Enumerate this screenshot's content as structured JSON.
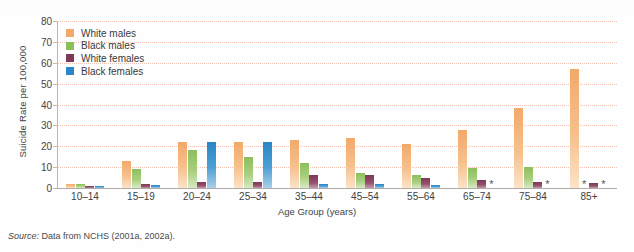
{
  "figure": {
    "title_fragment": "",
    "source_note": "Source: Data from NCHS (2001a, 2002a)."
  },
  "legend": {
    "position": "top-left-inside",
    "items": [
      {
        "label": "White males",
        "color": "#f3a96a",
        "key": "white_males"
      },
      {
        "label": "Black males",
        "color": "#8cbf5c",
        "key": "black_males"
      },
      {
        "label": "White females",
        "color": "#7c3a58",
        "key": "white_females"
      },
      {
        "label": "Black females",
        "color": "#2a86c4",
        "key": "black_females"
      }
    ]
  },
  "chart_data": {
    "type": "bar",
    "title": "",
    "xlabel": "Age Group (years)",
    "ylabel": "Suicide Rate per 100,000",
    "ylim": [
      0,
      80
    ],
    "yticks": [
      0,
      10,
      20,
      30,
      40,
      50,
      60,
      70,
      80
    ],
    "grid": true,
    "suppressed_marker": "*",
    "categories": [
      "10–14",
      "15–19",
      "20–24",
      "25–34",
      "35–44",
      "45–54",
      "55–64",
      "65–74",
      "75–84",
      "85+"
    ],
    "series": [
      {
        "name": "White males",
        "color": "#f3a96a",
        "values": [
          2.0,
          13.0,
          22.0,
          22.0,
          23.0,
          24.0,
          21.0,
          28.0,
          38.5,
          57.0
        ]
      },
      {
        "name": "Black males",
        "color": "#8cbf5c",
        "values": [
          2.0,
          9.0,
          18.0,
          15.0,
          12.0,
          7.0,
          6.0,
          9.5,
          10.0,
          null
        ]
      },
      {
        "name": "White females",
        "color": "#7c3a58",
        "values": [
          0.8,
          2.0,
          3.0,
          3.0,
          6.0,
          6.0,
          5.0,
          4.0,
          3.0,
          2.5
        ]
      },
      {
        "name": "Black females",
        "color": "#2a86c4",
        "values": [
          1.0,
          1.5,
          22.0,
          22.0,
          2.0,
          2.0,
          1.5,
          null,
          null,
          null
        ]
      }
    ]
  }
}
